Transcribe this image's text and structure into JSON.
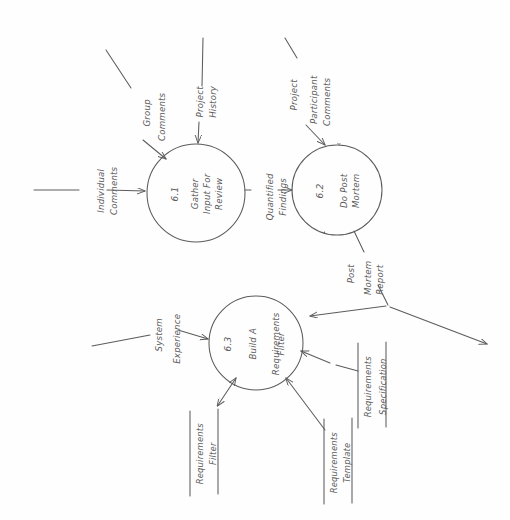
{
  "diagram": {
    "type": "data-flow-diagram",
    "style": "hand-drawn pencil sketch on white paper, rotated 90 degrees",
    "ink_color": "#5c5c5c",
    "paper_color": "#fefefe"
  },
  "processes": [
    {
      "id": "6.1",
      "number": "6.1",
      "name_line1": "Gather",
      "name_line2": "Input For",
      "name_line3": "Review",
      "name": "Gather Input For Review"
    },
    {
      "id": "6.2",
      "number": "6.2",
      "name_line1": "Do Post",
      "name_line2": "Mortem",
      "name": "Do Post Mortem"
    },
    {
      "id": "6.3",
      "number": "6.3",
      "name_line1": "Build A",
      "name_line2": "Requirements",
      "name_line3": "Filter",
      "name": "Build A Requirements Filter"
    }
  ],
  "data_stores": [
    {
      "id": "ds1",
      "line1": "Requirements",
      "line2": "Filter",
      "name": "Requirements Filter"
    },
    {
      "id": "ds2",
      "line1": "Requirements",
      "line2": "Template",
      "name": "Requirements Template"
    },
    {
      "id": "ds3",
      "line1": "Requirements",
      "line2": "Specification",
      "name": "Requirements Specification"
    }
  ],
  "data_flows": [
    {
      "id": "f1",
      "line1": "Individual",
      "line2": "Comments",
      "name": "Individual Comments",
      "to": "6.1"
    },
    {
      "id": "f2",
      "line1": "Group",
      "line2": "Comments",
      "name": "Group Comments",
      "to": "6.1"
    },
    {
      "id": "f3",
      "line1": "Project",
      "line2": "History",
      "name": "Project History",
      "to": "6.1"
    },
    {
      "id": "f4",
      "line1": "Quantified",
      "line2": "Findings",
      "name": "Quantified Findings",
      "from": "6.1",
      "to": "6.2"
    },
    {
      "id": "f5",
      "line1": "Project",
      "line2": "Participant",
      "line3": "Comments",
      "name": "Project Participant Comments",
      "to": "6.2"
    },
    {
      "id": "f6",
      "line1": "Post",
      "line2": "Mortem",
      "line3": "Report",
      "name": "Post Mortem Report",
      "from": "6.2",
      "to": "6.3"
    },
    {
      "id": "f7",
      "line1": "System",
      "line2": "Experience",
      "name": "System Experience",
      "to": "6.3"
    }
  ]
}
